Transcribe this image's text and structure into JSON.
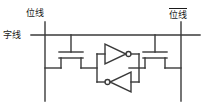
{
  "diagram": {
    "type": "6T SRAM memory cell schematic",
    "labels": {
      "bitline_left": "位线",
      "bitline_right": "位线",
      "bitline_right_complement": true,
      "wordline": "字线"
    },
    "components": {
      "access_transistor_left": "nmos-transistor",
      "access_transistor_right": "nmos-transistor",
      "inverter_top": "inverter-pointing-right",
      "inverter_bottom": "inverter-pointing-left"
    },
    "colors": {
      "line": "#3a3a3a",
      "text": "#1a1a1a",
      "background": "#ffffff"
    }
  }
}
